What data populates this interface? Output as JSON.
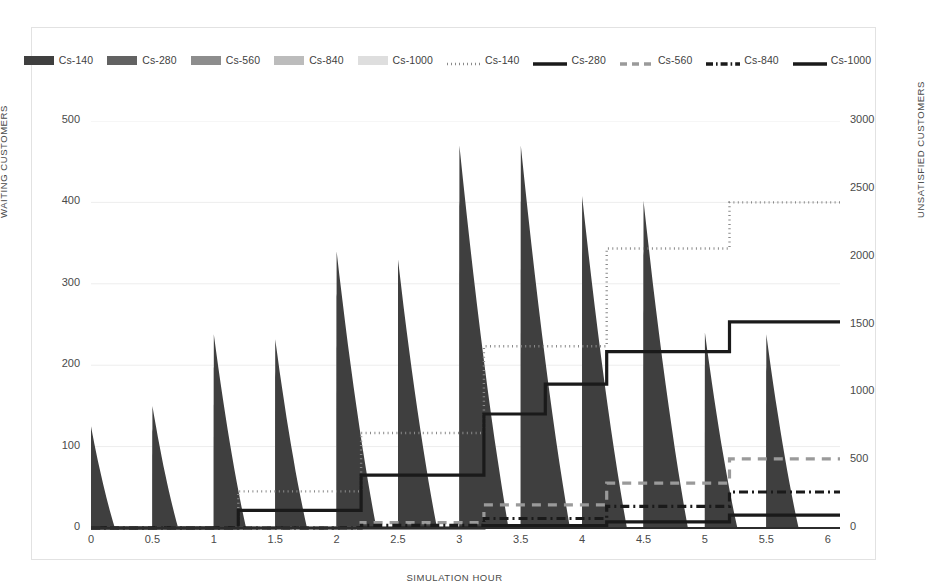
{
  "chart_data": {
    "type": "area",
    "title": "",
    "xlabel": "SIMULATION HOUR",
    "ylabel": "WAITING CUSTOMERS",
    "ylabel_secondary": "UNSATISFIED CUSTOMERS",
    "xlim": [
      0,
      6.1
    ],
    "ylim": [
      0,
      500
    ],
    "ylim_secondary": [
      0,
      3000
    ],
    "xticks": [
      "0",
      "0.5",
      "1",
      "1.5",
      "2",
      "2.5",
      "3",
      "3.5",
      "4",
      "4.5",
      "5",
      "5.5",
      "6"
    ],
    "xtick_values": [
      0,
      0.5,
      1,
      1.5,
      2,
      2.5,
      3,
      3.5,
      4,
      4.5,
      5,
      5.5,
      6
    ],
    "yticks": [
      "0",
      "100",
      "200",
      "300",
      "400",
      "500"
    ],
    "ytick_values": [
      0,
      100,
      200,
      300,
      400,
      500
    ],
    "yticks_secondary": [
      "0",
      "500",
      "1000",
      "1500",
      "2000",
      "2500",
      "3000"
    ],
    "ytick_values_secondary": [
      0,
      500,
      1000,
      1500,
      2000,
      2500,
      3000
    ],
    "grid": true,
    "legend_position": "top",
    "legend": [
      {
        "label": "Cs-140",
        "style": "area",
        "color": "#3f3f3f"
      },
      {
        "label": "Cs-280",
        "style": "area",
        "color": "#626262"
      },
      {
        "label": "Cs-560",
        "style": "area",
        "color": "#8d8d8d"
      },
      {
        "label": "Cs-840",
        "style": "area",
        "color": "#bcbcbc"
      },
      {
        "label": "Cs-1000",
        "style": "area",
        "color": "#dedede"
      },
      {
        "label": "Cs-140",
        "style": "dotted",
        "color": "#8a8a8a"
      },
      {
        "label": "Cs-280",
        "style": "solid",
        "color": "#1a1a1a"
      },
      {
        "label": "Cs-560",
        "style": "dashed",
        "color": "#9a9a9a"
      },
      {
        "label": "Cs-840",
        "style": "dashdot",
        "color": "#1a1a1a"
      },
      {
        "label": "Cs-1000",
        "style": "solid",
        "color": "#1a1a1a"
      }
    ],
    "area_series": [
      {
        "name": "Cs-140",
        "color": "#3f3f3f",
        "peaks": [
          125,
          150,
          238,
          232,
          340,
          330,
          470,
          470,
          408,
          402,
          240,
          238
        ]
      },
      {
        "name": "Cs-280",
        "color": "#626262",
        "peaks": [
          98,
          122,
          198,
          192,
          288,
          280,
          402,
          402,
          345,
          340,
          200,
          198
        ]
      },
      {
        "name": "Cs-560",
        "color": "#8d8d8d",
        "peaks": [
          72,
          92,
          152,
          148,
          224,
          218,
          318,
          318,
          272,
          268,
          158,
          156
        ]
      },
      {
        "name": "Cs-840",
        "color": "#bcbcbc",
        "peaks": [
          52,
          68,
          112,
          110,
          168,
          164,
          240,
          240,
          205,
          202,
          118,
          116
        ]
      },
      {
        "name": "Cs-1000",
        "color": "#dedede",
        "peaks": [
          46,
          60,
          100,
          98,
          150,
          146,
          215,
          215,
          183,
          180,
          105,
          103
        ]
      }
    ],
    "peak_hours": [
      0,
      0.5,
      1,
      1.5,
      2,
      2.5,
      3,
      3.5,
      4,
      4.5,
      5,
      5.5
    ],
    "step_series": [
      {
        "name": "Cs-140",
        "style": "dotted",
        "color": "#8a8a8a",
        "axis": "secondary",
        "x": [
          0,
          1.2,
          1.2,
          2.2,
          2.2,
          3.2,
          3.2,
          4.2,
          4.2,
          5.2,
          5.2,
          6.1
        ],
        "values": [
          0,
          0,
          270,
          270,
          700,
          700,
          1340,
          1340,
          2060,
          2060,
          2400,
          2400
        ]
      },
      {
        "name": "Cs-280",
        "style": "solid",
        "color": "#1a1a1a",
        "axis": "secondary",
        "x": [
          0,
          1.2,
          1.2,
          2.2,
          2.2,
          3.2,
          3.2,
          3.7,
          3.7,
          4.2,
          4.2,
          5.2,
          5.2,
          6.1
        ],
        "values": [
          0,
          0,
          130,
          130,
          390,
          390,
          840,
          840,
          1060,
          1060,
          1300,
          1300,
          1520,
          1520
        ]
      },
      {
        "name": "Cs-560",
        "style": "dashed",
        "color": "#9a9a9a",
        "axis": "secondary",
        "x": [
          0,
          2.2,
          2.2,
          3.2,
          3.2,
          4.2,
          4.2,
          5.2,
          5.2,
          6.1
        ],
        "values": [
          0,
          0,
          40,
          40,
          170,
          170,
          330,
          330,
          510,
          510
        ]
      },
      {
        "name": "Cs-840",
        "style": "dashdot",
        "color": "#1a1a1a",
        "axis": "secondary",
        "x": [
          0,
          2.2,
          2.2,
          3.2,
          3.2,
          4.2,
          4.2,
          5.2,
          5.2,
          6.1
        ],
        "values": [
          0,
          0,
          20,
          20,
          70,
          70,
          160,
          160,
          265,
          265
        ]
      },
      {
        "name": "Cs-1000",
        "style": "solid",
        "color": "#1a1a1a",
        "axis": "secondary",
        "x": [
          0,
          3.2,
          3.2,
          4.2,
          4.2,
          5.2,
          5.2,
          6.1
        ],
        "values": [
          0,
          0,
          18,
          18,
          45,
          45,
          95,
          95
        ]
      }
    ]
  }
}
